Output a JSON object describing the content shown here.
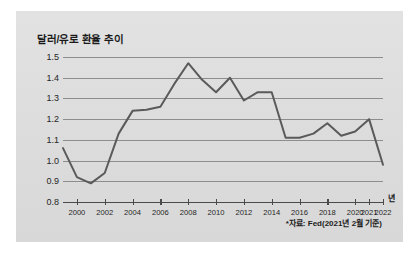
{
  "card": {
    "background_color": "#dedede"
  },
  "chart_data": {
    "type": "line",
    "title": "달러/유로 환율 추이",
    "xlabel": "년",
    "ylabel": "",
    "source_note": "*자료: Fed(2021년 2월 기준)",
    "line_color": "#5a5a5a",
    "grid": true,
    "legend": "none",
    "ylim": [
      0.8,
      1.5
    ],
    "ytick_labels": [
      "1.5",
      "1.4",
      "1.3",
      "1.2",
      "1.1",
      "1.0",
      "0.9",
      "0.8"
    ],
    "ytick_values": [
      1.5,
      1.4,
      1.3,
      1.2,
      1.1,
      1.0,
      0.9,
      0.8
    ],
    "xtick_labels": [
      "2000",
      "2002",
      "2004",
      "2006",
      "2008",
      "2010",
      "2012",
      "2014",
      "2016",
      "2018",
      "2020",
      "2021",
      "2022"
    ],
    "xtick_values": [
      2000,
      2002,
      2004,
      2006,
      2008,
      2010,
      2012,
      2014,
      2016,
      2018,
      2020,
      2021,
      2022
    ],
    "x": [
      1999,
      2000,
      2001,
      2002,
      2003,
      2004,
      2005,
      2006,
      2007,
      2008,
      2009,
      2010,
      2011,
      2012,
      2013,
      2014,
      2015,
      2016,
      2017,
      2018,
      2019,
      2020,
      2021,
      2022
    ],
    "values": [
      1.06,
      0.92,
      0.89,
      0.94,
      1.13,
      1.24,
      1.245,
      1.26,
      1.37,
      1.47,
      1.39,
      1.33,
      1.4,
      1.29,
      1.33,
      1.33,
      1.11,
      1.11,
      1.13,
      1.18,
      1.12,
      1.14,
      1.2,
      0.98
    ]
  }
}
